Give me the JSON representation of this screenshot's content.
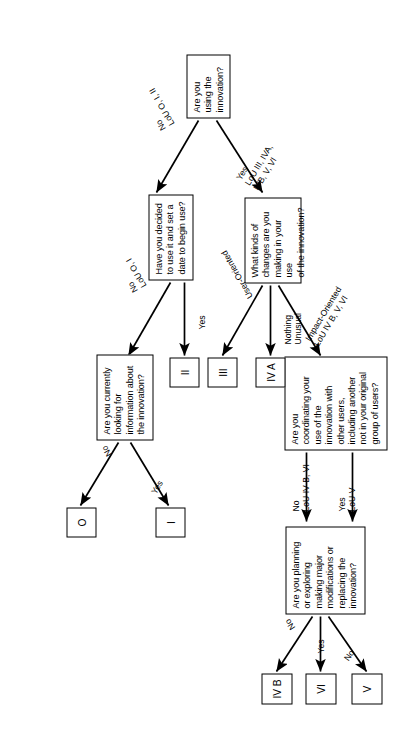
{
  "diagram": {
    "orientation": "rotated-90",
    "colors": {
      "line": "#000000",
      "box_fill": "#ffffff",
      "text": "#000000"
    }
  },
  "nodes": {
    "q_using": "Are you\nusing the\ninnovation?",
    "q_decided": "Have you decided\nto use it and set a\ndate to begin use?",
    "q_looking": "Are you currently\nlooking for\ninformation about\nthe innovation?",
    "q_changes": "What kinds of\nchanges are you\nmaking in your use\nof the innovation?",
    "q_coordinating": "Are you\ncoordinating your\nuse of the\ninnovation with\nother users,\nincluding another\nnot in your original\ngroup of users?",
    "q_planning": "Are you planning\nor exploring\nmaking major\nmodifications or\nreplacing the\ninnovation?"
  },
  "terminals": {
    "t_0": "O",
    "t_I": "I",
    "t_II": "II",
    "t_III": "III",
    "t_IVA": "IV A",
    "t_IVB": "IV B",
    "t_VI": "VI",
    "t_V": "V"
  },
  "edge_labels": {
    "using_no": "No\nLoU O, I, II",
    "using_yes": "Yes\nLoU III, IVA,\nIVB, V, VI",
    "decided_no": "No\nLoU O, I",
    "decided_yes": "Yes",
    "looking_no": "No",
    "looking_yes": "Yes",
    "changes_none": "Nothing\nUnusual",
    "changes_user": "User-Oriented",
    "changes_impact": "Impact-Oriented\nLoU IV B, V, VI",
    "coord_no": "No\nLoU IV B, VI",
    "coord_yes": "Yes\nLoU V",
    "planning_no_ivb": "No",
    "planning_yes": "Yes",
    "planning_no_v": "No"
  }
}
